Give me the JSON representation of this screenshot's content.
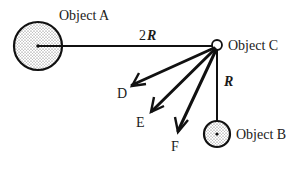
{
  "objects": {
    "a": {
      "label": "Object A"
    },
    "b": {
      "label": "Object B"
    },
    "c": {
      "label": "Object C"
    }
  },
  "distances": {
    "ac_prefix": "2",
    "ac_var": "R",
    "cb_var": "R"
  },
  "arrows": [
    {
      "label": "D"
    },
    {
      "label": "E"
    },
    {
      "label": "F"
    }
  ],
  "colors": {
    "stroke": "#111111",
    "dots": "#555555"
  }
}
